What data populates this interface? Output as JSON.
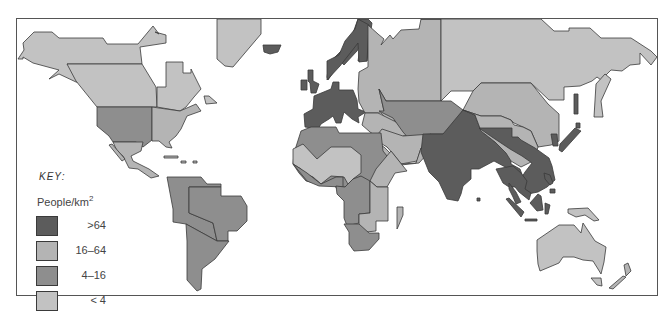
{
  "map": {
    "title": "World population density",
    "key": {
      "title": "KEY:",
      "unit": "People/km",
      "unit_exponent": "2",
      "classes": [
        {
          "label": ">64",
          "color": "#5c5c5c"
        },
        {
          "label": "16–64",
          "color": "#b4b4b4"
        },
        {
          "label": "4–16",
          "color": "#8e8e8e"
        },
        {
          "label": "< 4",
          "color": "#c2c2c2"
        }
      ]
    },
    "colors": {
      "high": "#5c5c5c",
      "upper_mid": "#b4b4b4",
      "lower_mid": "#8e8e8e",
      "low": "#c2c2c2",
      "outline": "#3a3a3a",
      "background": "#ffffff"
    },
    "regions": [
      {
        "name": "Alaska / Northern Canada",
        "class": "< 4"
      },
      {
        "name": "Canada",
        "class": "< 4"
      },
      {
        "name": "Greenland",
        "class": "< 4"
      },
      {
        "name": "USA (west)",
        "class": "4–16"
      },
      {
        "name": "USA (east)",
        "class": "16–64"
      },
      {
        "name": "Central America",
        "class": "16–64"
      },
      {
        "name": "South America (north-west)",
        "class": "4–16"
      },
      {
        "name": "Brazil",
        "class": "4–16"
      },
      {
        "name": "Southern South America",
        "class": "4–16"
      },
      {
        "name": "Europe (west)",
        "class": ">64"
      },
      {
        "name": "Scandinavia",
        "class": ">64"
      },
      {
        "name": "Eastern Europe / USSR (west)",
        "class": "16–64"
      },
      {
        "name": "Siberia",
        "class": "< 4"
      },
      {
        "name": "Central Asia",
        "class": "4–16"
      },
      {
        "name": "Middle East",
        "class": "16–64"
      },
      {
        "name": "North Africa",
        "class": "4–16"
      },
      {
        "name": "Sahara",
        "class": "< 4"
      },
      {
        "name": "Central Africa",
        "class": "4–16"
      },
      {
        "name": "East Africa",
        "class": "16–64"
      },
      {
        "name": "Southern Africa",
        "class": "4–16"
      },
      {
        "name": "Madagascar",
        "class": "16–64"
      },
      {
        "name": "India",
        "class": ">64"
      },
      {
        "name": "China (west) / Tibet",
        "class": "16–64"
      },
      {
        "name": "China (east)",
        "class": ">64"
      },
      {
        "name": "Mongolia",
        "class": "16–64"
      },
      {
        "name": "Japan",
        "class": ">64"
      },
      {
        "name": "South-East Asia",
        "class": ">64"
      },
      {
        "name": "Indonesia",
        "class": ">64"
      },
      {
        "name": "Australia",
        "class": "< 4"
      },
      {
        "name": "New Zealand",
        "class": "16–64"
      }
    ]
  }
}
